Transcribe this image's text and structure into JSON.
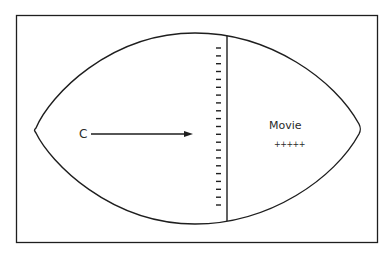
{
  "diagram": {
    "source_label": "C",
    "target_label": "Movie",
    "target_charges": "+++++",
    "boundary_charge_symbol": "-",
    "boundary_charge_count": 21,
    "colors": {
      "stroke": "#1e1e1e",
      "text": "#2a2a2a",
      "background": "#ffffff"
    }
  }
}
